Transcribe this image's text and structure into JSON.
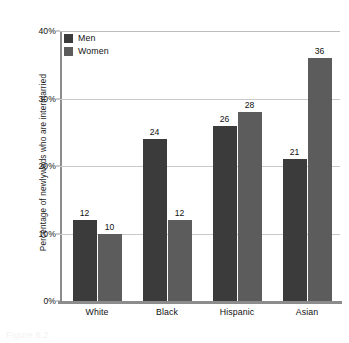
{
  "chart_data": {
    "type": "bar",
    "title": "",
    "xlabel": "",
    "ylabel": "Percentage of newlyweds who are intermarried",
    "categories": [
      "White",
      "Black",
      "Hispanic",
      "Asian"
    ],
    "series": [
      {
        "name": "Men",
        "color": "#3b3b3b",
        "values": [
          12,
          24,
          26,
          21
        ]
      },
      {
        "name": "Women",
        "color": "#5c5c5c",
        "values": [
          10,
          12,
          28,
          36
        ]
      }
    ],
    "ylim": [
      0,
      40
    ],
    "yticks": [
      0,
      10,
      20,
      30,
      40
    ],
    "ytick_labels": [
      "0%",
      "10%",
      "20%",
      "30%",
      "40%"
    ],
    "grid": true,
    "legend_position": "top-left",
    "value_labels": true
  },
  "legend": {
    "items": [
      {
        "label": "Men",
        "swatch": "men"
      },
      {
        "label": "Women",
        "swatch": "women"
      }
    ]
  },
  "caption": {
    "text": "Figure 6.2"
  },
  "colors": {
    "men": "#3b3b3b",
    "women": "#5c5c5c",
    "gridline": "#c9c9c9",
    "axis": "#8c8c8c",
    "text": "#111111",
    "background": "#ffffff"
  }
}
